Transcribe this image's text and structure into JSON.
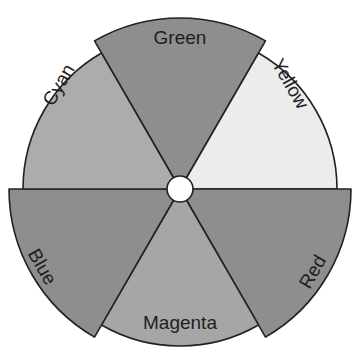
{
  "diagram": {
    "type": "color-wheel",
    "center": {
      "x": 180,
      "y": 189
    },
    "hub_radius": 13,
    "hub_color": "#ffffff",
    "segments": [
      {
        "label": "Green",
        "start_deg": 240,
        "end_deg": 300,
        "radius": 171,
        "fill": "#8e8e8e",
        "text_x": 180,
        "text_y": 44,
        "rotate": 0
      },
      {
        "label": "Yellow",
        "start_deg": 300,
        "end_deg": 360,
        "radius": 157,
        "fill": "#ececec",
        "text_x": 290,
        "text_y": 90,
        "rotate": 60
      },
      {
        "label": "Red",
        "start_deg": 0,
        "end_deg": 60,
        "radius": 171,
        "fill": "#8e8e8e",
        "text_x": 313,
        "text_y": 278,
        "rotate": -60
      },
      {
        "label": "Magenta",
        "start_deg": 60,
        "end_deg": 120,
        "radius": 157,
        "fill": "#a6a6a6",
        "text_x": 180,
        "text_y": 329,
        "rotate": 0
      },
      {
        "label": "Blue",
        "start_deg": 120,
        "end_deg": 180,
        "radius": 171,
        "fill": "#8e8e8e",
        "text_x": 42,
        "text_y": 273,
        "rotate": 60
      },
      {
        "label": "Cyan",
        "start_deg": 180,
        "end_deg": 240,
        "radius": 157,
        "fill": "#acacac",
        "text_x": 59,
        "text_y": 91,
        "rotate": -60
      }
    ]
  },
  "labels": {
    "green": "Green",
    "yellow": "Yellow",
    "red": "Red",
    "magenta": "Magenta",
    "blue": "Blue",
    "cyan": "Cyan"
  }
}
